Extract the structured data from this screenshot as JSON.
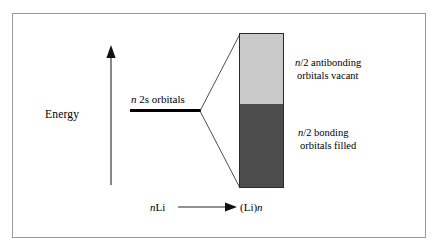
{
  "figure": {
    "type": "molecular-orbital-band-diagram",
    "background_color": "#ffffff",
    "frame_color": "#9a9a9a"
  },
  "axes": {
    "y_label": "Energy",
    "y_arrow_direction": "up",
    "x_left_term": "nLi",
    "x_right_term": "(Li)n",
    "x_arrow_direction": "right"
  },
  "level": {
    "label_italic": "n",
    "label_rest": " 2s orbitals",
    "label_full": "n 2s orbitals",
    "color": "#000000"
  },
  "band": {
    "antibonding": {
      "caption_italic": "n",
      "caption_line1_rest": "/2 antibonding",
      "caption_line2": "orbitals vacant",
      "caption_full": "n/2 antibonding orbitals vacant",
      "color": "#c9c9c9",
      "fill_state": "vacant",
      "fraction": 0.455
    },
    "bonding": {
      "caption_italic": "n",
      "caption_line1_rest": "/2 bonding",
      "caption_line2": "orbitals filled",
      "caption_full": "n/2 bonding orbitals filled",
      "color": "#4d4d4d",
      "fill_state": "filled",
      "fraction": 0.545
    },
    "border_color": "#2a2a2a"
  },
  "connectors": {
    "line_color": "#3a3a3a",
    "count": 2
  }
}
